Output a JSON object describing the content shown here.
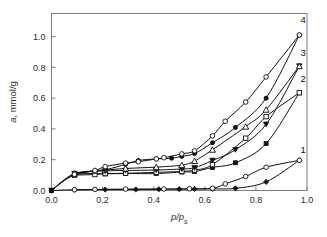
{
  "chart_data": {
    "type": "line",
    "title": "",
    "subtitle": "",
    "xlabel": "p/p",
    "xlabel_sub": "s",
    "ylabel": "a",
    "ylabel_rest": ", mmol/g",
    "xlim": [
      0.0,
      1.0
    ],
    "ylim": [
      0.0,
      1.15
    ],
    "grid": false,
    "legend_position": "inline-right-labels",
    "xticks": [
      "0.0",
      "0.2",
      "0.4",
      "0.6",
      "0.8",
      "1.0"
    ],
    "xtick_values": [
      0.0,
      0.2,
      0.4,
      0.6,
      0.8,
      1.0
    ],
    "yticks": [
      "0.0",
      "0.2",
      "0.4",
      "0.6",
      "0.8",
      "1.0"
    ],
    "ytick_values": [
      0.0,
      0.2,
      0.4,
      0.6,
      0.8,
      1.0
    ],
    "annotations": [
      {
        "text": "1",
        "x": 0.985,
        "y": 0.245
      },
      {
        "text": "2",
        "x": 0.985,
        "y": 0.705
      },
      {
        "text": "3",
        "x": 0.985,
        "y": 0.875
      },
      {
        "text": "4",
        "x": 0.985,
        "y": 1.09
      }
    ],
    "series": [
      {
        "name": "1 adsorption",
        "curve": "1",
        "branch": "adsorption",
        "marker": "filled-diamond",
        "x": [
          0.0,
          0.09,
          0.21,
          0.33,
          0.42,
          0.5,
          0.56,
          0.63,
          0.72,
          0.84,
          0.97
        ],
        "y": [
          0.0,
          0.005,
          0.006,
          0.007,
          0.008,
          0.009,
          0.01,
          0.011,
          0.014,
          0.056,
          0.196
        ]
      },
      {
        "name": "1 desorption",
        "curve": "1",
        "branch": "desorption",
        "marker": "open-circle",
        "x": [
          0.97,
          0.84,
          0.76,
          0.68,
          0.63,
          0.54,
          0.44,
          0.29,
          0.17,
          0.09
        ],
        "y": [
          0.196,
          0.151,
          0.091,
          0.043,
          0.014,
          0.011,
          0.01,
          0.009,
          0.007,
          0.005
        ]
      },
      {
        "name": "2 adsorption",
        "curve": "2",
        "branch": "adsorption",
        "marker": "filled-square",
        "x": [
          0.0,
          0.09,
          0.21,
          0.29,
          0.41,
          0.51,
          0.56,
          0.63,
          0.72,
          0.84,
          0.97
        ],
        "y": [
          0.0,
          0.1,
          0.108,
          0.11,
          0.11,
          0.12,
          0.123,
          0.15,
          0.18,
          0.305,
          0.635
        ]
      },
      {
        "name": "2 desorption",
        "curve": "2",
        "branch": "desorption",
        "marker": "open-square",
        "x": [
          0.97,
          0.84,
          0.76,
          0.63,
          0.56,
          0.51,
          0.41,
          0.29,
          0.21,
          0.17,
          0.09
        ],
        "y": [
          0.635,
          0.48,
          0.34,
          0.168,
          0.133,
          0.124,
          0.118,
          0.112,
          0.11,
          0.104,
          0.1
        ]
      },
      {
        "name": "3 adsorption",
        "curve": "3",
        "branch": "adsorption",
        "marker": "filled-triangle-down",
        "x": [
          0.0,
          0.09,
          0.21,
          0.29,
          0.41,
          0.51,
          0.56,
          0.63,
          0.72,
          0.84,
          0.97
        ],
        "y": [
          0.0,
          0.11,
          0.127,
          0.13,
          0.133,
          0.14,
          0.148,
          0.195,
          0.265,
          0.43,
          0.808
        ]
      },
      {
        "name": "3 desorption",
        "curve": "3",
        "branch": "desorption",
        "marker": "open-triangle-up",
        "x": [
          0.97,
          0.84,
          0.76,
          0.63,
          0.56,
          0.51,
          0.41,
          0.29,
          0.21,
          0.17,
          0.09
        ],
        "y": [
          0.808,
          0.525,
          0.415,
          0.265,
          0.192,
          0.165,
          0.152,
          0.143,
          0.133,
          0.128,
          0.11
        ]
      },
      {
        "name": "4 adsorption",
        "curve": "4",
        "branch": "adsorption",
        "marker": "filled-circle",
        "x": [
          0.0,
          0.09,
          0.21,
          0.29,
          0.34,
          0.41,
          0.47,
          0.51,
          0.56,
          0.63,
          0.72,
          0.84,
          0.97
        ],
        "y": [
          0.0,
          0.105,
          0.135,
          0.17,
          0.195,
          0.205,
          0.21,
          0.222,
          0.24,
          0.31,
          0.41,
          0.6,
          1.01
        ]
      },
      {
        "name": "4 desorption",
        "curve": "4",
        "branch": "desorption",
        "marker": "open-circle",
        "x": [
          0.97,
          0.84,
          0.76,
          0.68,
          0.63,
          0.56,
          0.51,
          0.44,
          0.41,
          0.34,
          0.29,
          0.21,
          0.17,
          0.09
        ],
        "y": [
          1.01,
          0.738,
          0.575,
          0.45,
          0.355,
          0.258,
          0.238,
          0.213,
          0.205,
          0.187,
          0.178,
          0.155,
          0.13,
          0.105
        ]
      }
    ]
  }
}
